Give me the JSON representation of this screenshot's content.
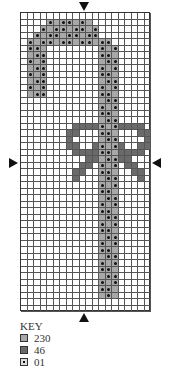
{
  "chart": {
    "cols": 20,
    "rows_count": 46,
    "legend_codes": {
      ".": "empty",
      "a": "230",
      "b": "46",
      "o": "01"
    },
    "rows": [
      "....................",
      "....oaooaoa.........",
      "...oaooaooao........",
      "..oaooaooaoo........",
      ".oaooaooaooaoo......",
      ".ooa........oao.....",
      ".aoo........ooa.....",
      ".oao........aoo.....",
      ".aoo........oao.....",
      ".oao........ooa.....",
      ".aoo........aoo.....",
      ".oao........oao.....",
      ".aoo........ooa.....",
      "............aoo.....",
      "............oao.....",
      "............ooa.....",
      "............aoo.....",
      "........bbbboaobbbb.",
      ".......bb...ooa...bb",
      ".......b....aoo....b",
      ".......bb..boaob..bb",
      "........bbbbooabbbb.",
      "..........bbaoobb...",
      ".........bb.oao.bb..",
      "........bb..ooa..bb.",
      "........b...aoo...b.",
      "............oao.....",
      "............ooa.....",
      "............aoo.....",
      "............oao.....",
      "............ooa.....",
      "............aoo.....",
      "............oao.....",
      "............ooa.....",
      "............aoo.....",
      "............oao.....",
      "............ooa.....",
      "............aoo.....",
      "............oao.....",
      "............ooa.....",
      "............aoo.....",
      "............oao.....",
      "............ooa.....",
      "............aoa.....",
      "....................",
      "...................."
    ]
  },
  "key": {
    "title": "KEY",
    "items": [
      {
        "swatch": "a",
        "label": "230"
      },
      {
        "swatch": "b",
        "label": "46"
      },
      {
        "swatch": "o",
        "label": "01"
      }
    ]
  }
}
